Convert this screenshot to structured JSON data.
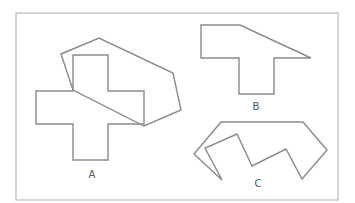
{
  "figure": {
    "frame": {
      "x": 16,
      "y": 13,
      "width": 322,
      "height": 187,
      "stroke": "#c8c8c8"
    },
    "stroke_color": "#8a8a8a",
    "shapes": [
      {
        "label": "A",
        "label_pos": [
          92,
          178
        ],
        "polygons": [
          {
            "name": "cross",
            "points": "73,55 108,55 108,91 144,91 144,124 108,124 108,160 73,160 73,124 36,124 36,91 73,91"
          },
          {
            "name": "hexagon",
            "points": "61,54 99,38 173,73 181,110 144,126 73,90"
          }
        ]
      },
      {
        "label": "B",
        "label_pos": [
          256,
          110
        ],
        "polygons": [
          {
            "name": "t-shape",
            "points": "201,25 240,25 311,58 274,58 274,94 239,94 239,58 201,58"
          }
        ]
      },
      {
        "label": "C",
        "label_pos": [
          258,
          187
        ],
        "polygons": [
          {
            "name": "zigzag",
            "points": "221,122 303,122 327,150 302,179 286,149 252,166 237,134 205,148 222,180 194,154"
          }
        ]
      }
    ]
  }
}
